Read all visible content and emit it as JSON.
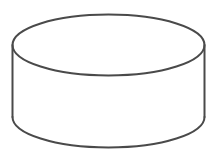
{
  "figure": {
    "name": "cylinder-line-drawing",
    "background_color": "#ffffff",
    "stroke_color": "#4a4a4a",
    "stroke_width": 2,
    "fill_color": "#ffffff",
    "geometry": {
      "canvas_width": 216,
      "canvas_height": 162,
      "top_ellipse": {
        "cx": 108.5,
        "cy": 45,
        "rx": 96,
        "ry": 30.5
      },
      "side_bottom_y": 117,
      "bottom_arc": {
        "cy": 117,
        "rx": 96,
        "ry": 30.5
      }
    }
  }
}
